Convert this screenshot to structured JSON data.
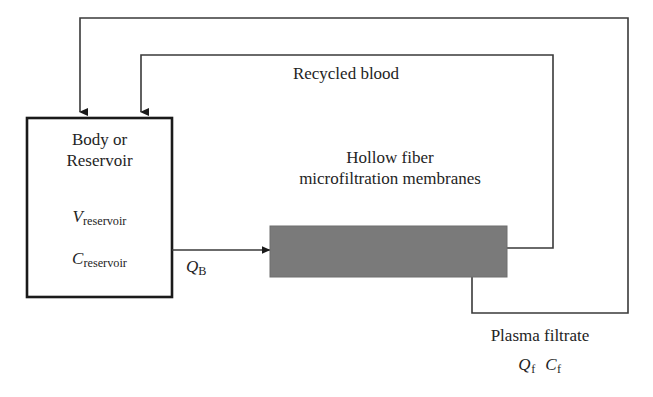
{
  "figure": {
    "type": "process-flow-diagram",
    "background_color": "#ffffff",
    "line_color": "#3a3a3a",
    "box_border_color": "#1a1a1a",
    "membrane_fill_color": "#7a7a7a",
    "text_color": "#242424"
  },
  "reservoir": {
    "title_line1": "Body or",
    "title_line2": "Reservoir",
    "volume_symbol": "V",
    "volume_subscript": "reservoir",
    "concentration_symbol": "C",
    "concentration_subscript": "reservoir"
  },
  "membrane": {
    "label_line1": "Hollow fiber",
    "label_line2": "microfiltration membranes"
  },
  "streams": {
    "blood_flow_symbol": "Q",
    "blood_flow_subscript": "B",
    "recycled_blood_label": "Recycled blood",
    "plasma_filtrate_label": "Plasma filtrate",
    "filtrate_flow_symbol": "Q",
    "filtrate_flow_subscript": "f",
    "filtrate_conc_symbol": "C",
    "filtrate_conc_subscript": "f"
  }
}
